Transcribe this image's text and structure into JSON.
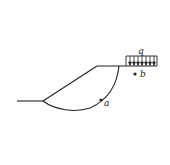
{
  "diagram": {
    "labels": {
      "load": "q",
      "point_a": "a",
      "point_b": "b"
    },
    "colors": {
      "line": "#222222",
      "background": "#ffffff"
    },
    "load_arrow_count": 7
  }
}
